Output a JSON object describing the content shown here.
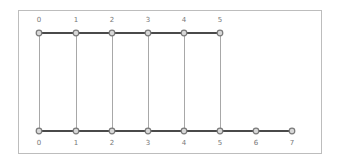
{
  "diagram": {
    "type": "ladder-graph",
    "frame": {
      "x": 18,
      "y": 10,
      "width": 303,
      "height": 143
    },
    "colors": {
      "frame": "#bdbdbd",
      "horizontal_edge": "#4a4a4a",
      "vertical_edge": "#a8a8a8",
      "node_fill": "#d8d8d8",
      "node_stroke": "#7a7a7a",
      "label": "#777777"
    },
    "top_row": {
      "y": 33,
      "label_y": 22,
      "nodes": [
        {
          "id": "0",
          "x": 39
        },
        {
          "id": "1",
          "x": 76
        },
        {
          "id": "2",
          "x": 112
        },
        {
          "id": "3",
          "x": 148
        },
        {
          "id": "4",
          "x": 184
        },
        {
          "id": "5",
          "x": 220
        }
      ]
    },
    "bottom_row": {
      "y": 131,
      "label_y": 145,
      "nodes": [
        {
          "id": "0",
          "x": 39
        },
        {
          "id": "1",
          "x": 76
        },
        {
          "id": "2",
          "x": 112
        },
        {
          "id": "3",
          "x": 148
        },
        {
          "id": "4",
          "x": 184
        },
        {
          "id": "5",
          "x": 220
        },
        {
          "id": "6",
          "x": 256
        },
        {
          "id": "7",
          "x": 292
        }
      ]
    },
    "vertical_links": [
      {
        "top": "0",
        "bottom": "0"
      },
      {
        "top": "1",
        "bottom": "1"
      },
      {
        "top": "2",
        "bottom": "2"
      },
      {
        "top": "3",
        "bottom": "3"
      },
      {
        "top": "4",
        "bottom": "4"
      },
      {
        "top": "5",
        "bottom": "5"
      }
    ]
  }
}
